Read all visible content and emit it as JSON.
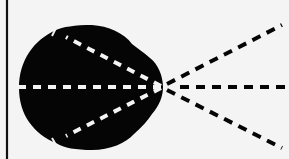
{
  "diagram": {
    "colors": {
      "background": "#f4f4f4",
      "lobe": "#050505",
      "inner_dash": "#f4f4f4",
      "outer_dash": "#050505",
      "frame_line": "#111111"
    },
    "origin": {
      "x": 163,
      "y": 87
    },
    "rays": [
      {
        "name": "upper",
        "outer_end": {
          "x": 282,
          "y": 25
        },
        "inner_end": {
          "x": 55,
          "y": 31
        }
      },
      {
        "name": "center",
        "outer_end": {
          "x": 289,
          "y": 87
        },
        "inner_end": {
          "x": 19,
          "y": 87
        }
      },
      {
        "name": "lower",
        "outer_end": {
          "x": 282,
          "y": 148
        },
        "inner_end": {
          "x": 55,
          "y": 141
        }
      }
    ]
  }
}
